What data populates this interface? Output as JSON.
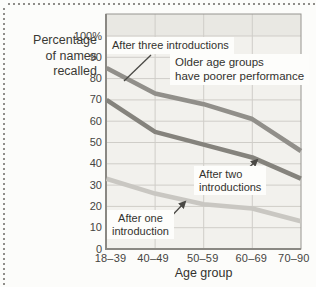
{
  "figure": {
    "y_axis_title": "Percentage\nof names\nrecalled",
    "x_axis_title": "Age group",
    "annotation": "Older age groups\nhave poorer performance",
    "series_labels": {
      "three": "After three introductions",
      "two": "After two\nintroductions",
      "one": "After one\nintroduction"
    }
  },
  "chart_data": {
    "type": "line",
    "categories": [
      "18–39",
      "40–49",
      "50–59",
      "60–69",
      "70–90"
    ],
    "series": [
      {
        "name": "After three introductions",
        "values": [
          85,
          73,
          68,
          61,
          46
        ],
        "color": "#918f8a"
      },
      {
        "name": "After two introductions",
        "values": [
          70,
          55,
          49,
          43,
          33
        ],
        "color": "#85837d"
      },
      {
        "name": "After one introduction",
        "values": [
          33,
          26,
          21,
          19,
          13
        ],
        "color": "#c9c7c2"
      }
    ],
    "title": "",
    "xlabel": "Age group",
    "ylabel": "Percentage of names recalled",
    "ylim": [
      0,
      100
    ],
    "yticks": [
      "0",
      "10",
      "20",
      "30",
      "40",
      "50",
      "60",
      "70",
      "80",
      "90",
      "100%"
    ],
    "grid": true,
    "legend_position": "inline-callouts",
    "annotation": "Older age groups have poorer performance",
    "colors": {
      "plot_bg": "#f2f1ed",
      "band_bg": "#e9e8e3",
      "grid": "#cfcdc8",
      "border": "#96948f",
      "axis": "#8a8883",
      "callout": "#4a4945",
      "text": "#3a3934"
    }
  }
}
